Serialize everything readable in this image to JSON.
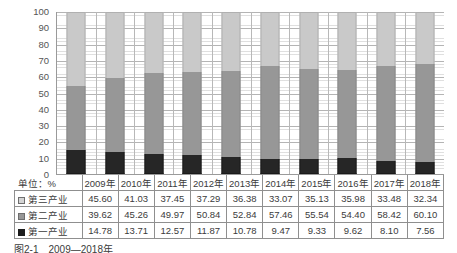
{
  "chart_data": {
    "type": "bar",
    "subtype": "100% stacked bar",
    "title": "",
    "xlabel": "",
    "ylabel": "",
    "unit_label": "单位：%",
    "ylim": [
      0,
      100
    ],
    "yticks": [
      100,
      90,
      80,
      70,
      60,
      50,
      40,
      30,
      20,
      10,
      0
    ],
    "grid": true,
    "legend_position": "table-row-labels",
    "categories": [
      "2009年",
      "2010年",
      "2011年",
      "2012年",
      "2013年",
      "2014年",
      "2015年",
      "2016年",
      "2017年",
      "2018年"
    ],
    "series": [
      {
        "name": "第三产业",
        "color": "#c9c9c9",
        "marker": "light-gray-square",
        "values": [
          45.6,
          41.03,
          37.45,
          37.29,
          36.38,
          33.07,
          35.13,
          35.98,
          33.48,
          32.34
        ]
      },
      {
        "name": "第二产业",
        "color": "#979797",
        "marker": "medium-gray-square",
        "values": [
          39.62,
          45.26,
          49.97,
          50.84,
          52.84,
          57.46,
          55.54,
          54.4,
          58.42,
          60.1
        ]
      },
      {
        "name": "第一产业",
        "color": "#262626",
        "marker": "black-square",
        "values": [
          14.78,
          13.71,
          12.57,
          11.87,
          10.78,
          9.47,
          9.33,
          9.62,
          8.1,
          7.56
        ]
      }
    ]
  },
  "table": {
    "corner_label": "单位：%",
    "header": [
      "2009年",
      "2010年",
      "2011年",
      "2012年",
      "2013年",
      "2014年",
      "2015年",
      "2016年",
      "2017年",
      "2018年"
    ],
    "rows": [
      {
        "label": "第三产业",
        "swatch": "light-gray-square",
        "cells": [
          "45.60",
          "41.03",
          "37.45",
          "37.29",
          "36.38",
          "33.07",
          "35.13",
          "35.98",
          "33.48",
          "32.34"
        ]
      },
      {
        "label": "第二产业",
        "swatch": "medium-gray-square",
        "cells": [
          "39.62",
          "45.26",
          "49.97",
          "50.84",
          "52.84",
          "57.46",
          "55.54",
          "54.40",
          "58.42",
          "60.10"
        ]
      },
      {
        "label": "第一产业",
        "swatch": "black-square",
        "cells": [
          "14.78",
          "13.71",
          "12.57",
          "11.87",
          "10.78",
          "9.47",
          "9.33",
          "9.62",
          "8.10",
          "7.56"
        ]
      }
    ]
  },
  "caption": {
    "text": "图2-1　2009—2018年"
  },
  "colors": {
    "tertiary": "#c9c9c9",
    "secondary": "#979797",
    "primary": "#262626",
    "axis": "#9a9a9a",
    "gridline": "#b4b4b4",
    "text": "#3b3b3b"
  }
}
